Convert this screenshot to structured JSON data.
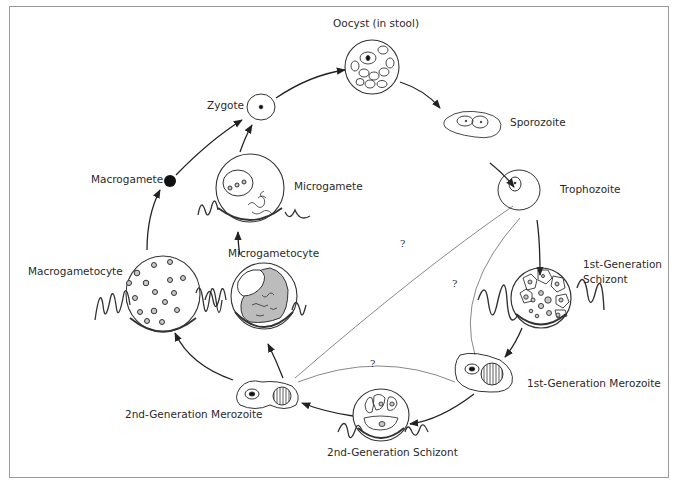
{
  "diagram": {
    "type": "life-cycle",
    "stages": [
      {
        "id": "oocyst",
        "label": "Oocyst (in stool)"
      },
      {
        "id": "sporozoite",
        "label": "Sporozoite"
      },
      {
        "id": "trophozoite",
        "label": "Trophozoite"
      },
      {
        "id": "schizont1",
        "label_line1": "1st-Generation",
        "label_line2": "Schizont"
      },
      {
        "id": "merozoite1",
        "label": "1st-Generation Merozoite"
      },
      {
        "id": "schizont2",
        "label": "2nd-Generation Schizont"
      },
      {
        "id": "merozoite2",
        "label": "2nd-Generation Merozoite"
      },
      {
        "id": "macrogametocyte",
        "label": "Macrogametocyte"
      },
      {
        "id": "microgametocyte",
        "label": "Microgametocyte"
      },
      {
        "id": "macrogamete",
        "label": "Macrogamete"
      },
      {
        "id": "microgamete",
        "label": "Microgamete"
      },
      {
        "id": "zygote",
        "label": "Zygote"
      }
    ],
    "uncertain_marker": "?",
    "arrows": [
      {
        "from": "zygote",
        "to": "oocyst"
      },
      {
        "from": "oocyst",
        "to": "sporozoite"
      },
      {
        "from": "sporozoite",
        "to": "trophozoite"
      },
      {
        "from": "trophozoite",
        "to": "schizont1"
      },
      {
        "from": "schizont1",
        "to": "merozoite1"
      },
      {
        "from": "merozoite1",
        "to": "schizont2"
      },
      {
        "from": "schizont2",
        "to": "merozoite2"
      },
      {
        "from": "merozoite2",
        "to": "macrogametocyte"
      },
      {
        "from": "merozoite2",
        "to": "microgametocyte"
      },
      {
        "from": "macrogametocyte",
        "to": "macrogamete"
      },
      {
        "from": "microgametocyte",
        "to": "microgamete"
      },
      {
        "from": "macrogamete",
        "to": "zygote"
      },
      {
        "from": "microgamete",
        "to": "zygote"
      }
    ],
    "uncertain_links": [
      {
        "from": "trophozoite",
        "to": "merozoite2",
        "label": "?"
      },
      {
        "from": "trophozoite",
        "to": "merozoite1",
        "label": "?"
      },
      {
        "from": "merozoite1",
        "to": "merozoite2",
        "label": "?"
      }
    ]
  }
}
